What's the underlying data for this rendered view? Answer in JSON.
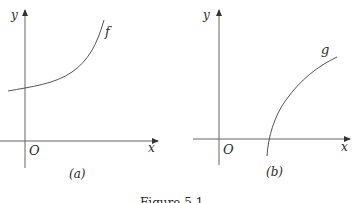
{
  "figure": {
    "caption": "Figure 5.1",
    "panels": [
      {
        "id": "a",
        "label": "(a)",
        "function_label": "f",
        "x_axis_label": "x",
        "y_axis_label": "y",
        "origin_label": "O",
        "curve_description": "increasing, convex, exponential-like curve with positive y-intercept"
      },
      {
        "id": "b",
        "label": "(b)",
        "function_label": "g",
        "x_axis_label": "x",
        "y_axis_label": "y",
        "origin_label": "O",
        "curve_description": "increasing, concave, logarithm-like curve crossing x-axis at positive x"
      }
    ],
    "colors": {
      "line": "#555555",
      "text": "#2a2a2a"
    }
  }
}
